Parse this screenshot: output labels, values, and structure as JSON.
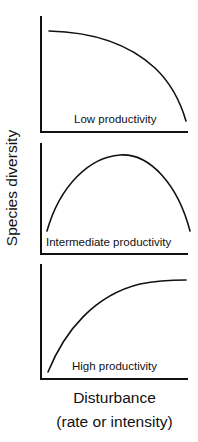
{
  "figure": {
    "y_axis_label": "Species diversity",
    "x_axis_label_line1": "Disturbance",
    "x_axis_label_line2": "(rate or intensity)",
    "panels": [
      {
        "label": "Low productivity",
        "trend": "decreasing (high at low disturbance, falls steeply at high disturbance)"
      },
      {
        "label": "Intermediate productivity",
        "trend": "hump-shaped (peak at intermediate disturbance)"
      },
      {
        "label": "High productivity",
        "trend": "increasing (saturating)"
      }
    ],
    "colors": {
      "line": "#111111",
      "background": "#ffffff"
    }
  }
}
